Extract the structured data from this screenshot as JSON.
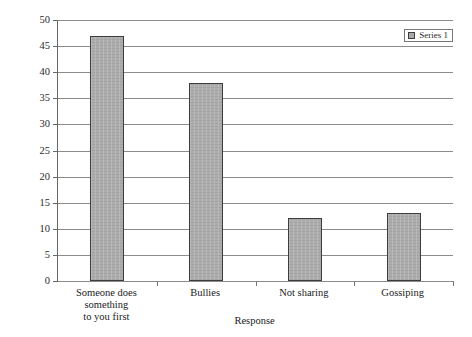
{
  "figure": {
    "top_caption_remnant": "",
    "background_color": "#ffffff"
  },
  "legend": {
    "position": "top-right",
    "entries": [
      {
        "label": "Series 1",
        "color": "#a9a9a9"
      }
    ]
  },
  "axis": {
    "y_ticks": [
      "50",
      "45",
      "40",
      "35",
      "30",
      "25",
      "20",
      "15",
      "10",
      "5",
      "0"
    ],
    "x_title": "Response"
  },
  "chart_data": {
    "type": "bar",
    "title": "",
    "subtitle": "",
    "xlabel": "Response",
    "ylabel": "",
    "categories": [
      "Someone does something to you first",
      "Bullies",
      "Not sharing",
      "Gossiping"
    ],
    "category_lines": [
      [
        "Someone does something",
        "to you first"
      ],
      [
        "Bullies"
      ],
      [
        "Not sharing"
      ],
      [
        "Gossiping"
      ]
    ],
    "series": [
      {
        "name": "Series 1",
        "color": "#a9a9a9",
        "values": [
          47,
          38,
          12,
          13
        ]
      }
    ],
    "values": [
      47,
      38,
      12,
      13
    ],
    "ylim": [
      0,
      50
    ],
    "ytick_step": 5,
    "yticks": [
      0,
      5,
      10,
      15,
      20,
      25,
      30,
      35,
      40,
      45,
      50
    ],
    "grid": "horizontal",
    "legend_position": "top-right",
    "bar_edge_color": "#3d3d3d",
    "gridline_color": "#8b8b8b",
    "axis_color": "#666666"
  }
}
